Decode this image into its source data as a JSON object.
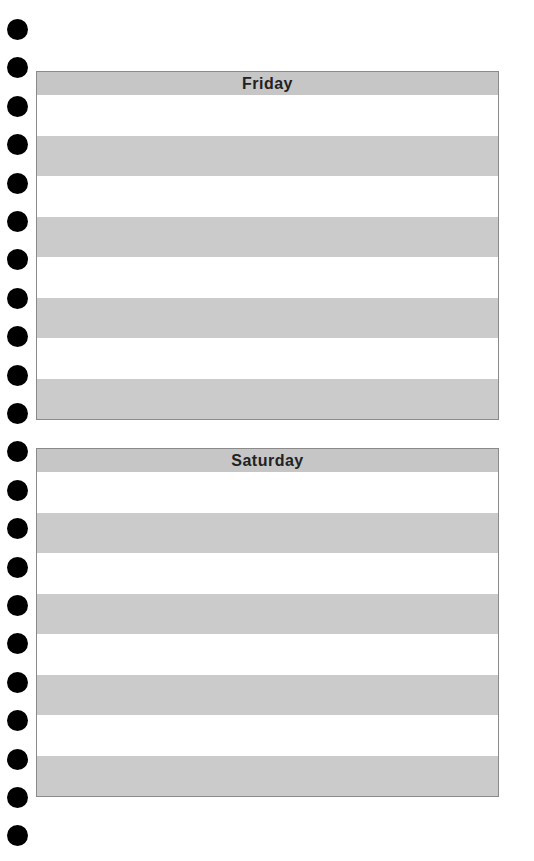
{
  "punch_holes": {
    "count": 22,
    "top_start": 19,
    "spacing": 38.4
  },
  "days": [
    {
      "label": "Friday",
      "rows": 8
    },
    {
      "label": "Saturday",
      "rows": 8
    }
  ],
  "colors": {
    "band": "#cbcbcb",
    "header": "#c6c6c6",
    "border": "#8a8a8a",
    "hole": "#000000"
  }
}
